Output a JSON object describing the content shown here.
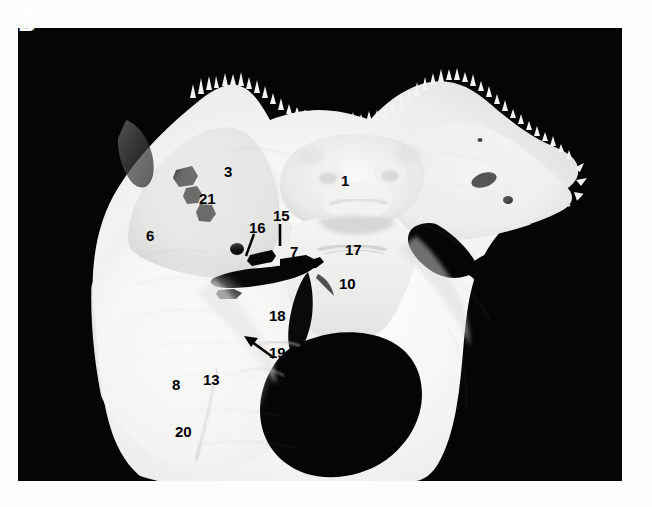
{
  "figure": {
    "panel_letter": "B",
    "background_color": "#ffffff",
    "plate_background_color": "#050505",
    "bone_color": "#f6f6f4",
    "label_color": "#000000",
    "specimen_description": "Skull base, interior view of middle cranial fossa and sphenoid bone on black background",
    "plate": {
      "x": 18,
      "y": 28,
      "width": 604,
      "height": 453
    }
  },
  "labels": [
    {
      "id": "1",
      "text": "1",
      "x": 341,
      "y": 173,
      "leader": "none"
    },
    {
      "id": "3",
      "text": "3",
      "x": 224,
      "y": 164,
      "leader": "none"
    },
    {
      "id": "6",
      "text": "6",
      "x": 146,
      "y": 228,
      "leader": "none"
    },
    {
      "id": "7",
      "text": "7",
      "x": 290,
      "y": 244,
      "leader": "none"
    },
    {
      "id": "8",
      "text": "8",
      "x": 172,
      "y": 377,
      "leader": "none"
    },
    {
      "id": "10",
      "text": "10",
      "x": 339,
      "y": 276,
      "leader": "none"
    },
    {
      "id": "13",
      "text": "13",
      "x": 203,
      "y": 372,
      "leader": "none"
    },
    {
      "id": "15",
      "text": "15",
      "x": 273,
      "y": 208,
      "leader": "line-down"
    },
    {
      "id": "16",
      "text": "16",
      "x": 249,
      "y": 220,
      "leader": "line-down-left"
    },
    {
      "id": "17",
      "text": "17",
      "x": 345,
      "y": 242,
      "leader": "none"
    },
    {
      "id": "18",
      "text": "18",
      "x": 269,
      "y": 308,
      "leader": "none"
    },
    {
      "id": "19",
      "text": "19",
      "x": 269,
      "y": 345,
      "leader": "arrow-up-left"
    },
    {
      "id": "20",
      "text": "20",
      "x": 175,
      "y": 424,
      "leader": "none"
    },
    {
      "id": "21",
      "text": "21",
      "x": 199,
      "y": 191,
      "leader": "none"
    }
  ]
}
